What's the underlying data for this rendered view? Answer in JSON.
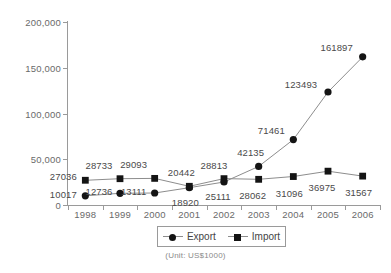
{
  "chart_data": {
    "type": "line",
    "title": "",
    "xlabel": "",
    "ylabel": "",
    "categories": [
      "1998",
      "1999",
      "2000",
      "2001",
      "2002",
      "2003",
      "2004",
      "2005",
      "2006"
    ],
    "series": [
      {
        "name": "Export",
        "marker": "circle",
        "values": [
          10017,
          12736,
          13111,
          18920,
          25111,
          42135,
          71461,
          123493,
          161897
        ]
      },
      {
        "name": "Import",
        "marker": "square",
        "values": [
          27036,
          28733,
          29093,
          20442,
          28813,
          28062,
          31096,
          36975,
          31567
        ]
      }
    ],
    "ylim": [
      0,
      200000
    ],
    "ytick_labels": [
      "0",
      "50,000",
      "100,000",
      "150,000",
      "200,000"
    ],
    "ytick_values": [
      0,
      50000,
      100000,
      150000,
      200000
    ],
    "grid": false,
    "legend_position": "bottom",
    "annotation": "(Unit: US$1000)",
    "colors": {
      "marker": "#141414",
      "line": "#8d8d8d",
      "axis": "#9a9a9a",
      "text": "#555555"
    }
  },
  "legend": {
    "items": [
      {
        "label": "Export"
      },
      {
        "label": "Import"
      }
    ]
  },
  "unit_note": "(Unit: US$1000)"
}
